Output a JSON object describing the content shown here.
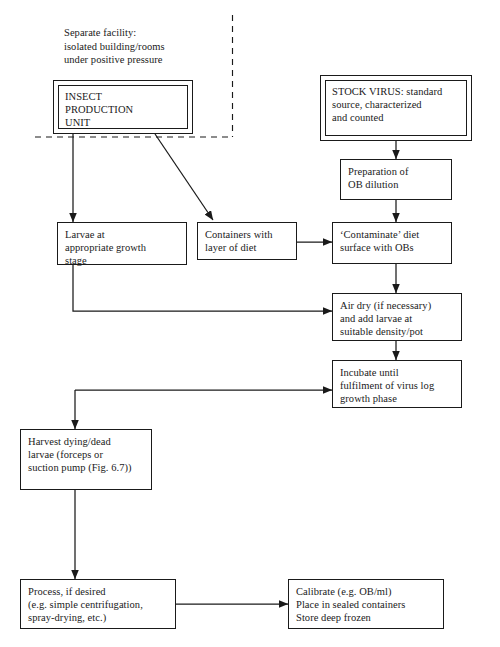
{
  "figure": {
    "kind": "process-flowchart",
    "title_text": "",
    "line_color": "#1a1a1a",
    "box_fill": "#ffffff",
    "page_background": "#ffffff"
  },
  "annotations": [
    {
      "name": "separate-facility-caption",
      "text": "Separate facility:\nisolated building/rooms\nunder positive pressure"
    }
  ],
  "nodes": [
    {
      "name": "insect-production-unit",
      "text": "INSECT\nPRODUCTION\nUNIT",
      "style": "double"
    },
    {
      "name": "stock-virus",
      "text": "STOCK VIRUS: standard\nsource, characterized\nand counted",
      "style": "double"
    },
    {
      "name": "preparation-of-ob-dilution",
      "text": "Preparation of\nOB dilution",
      "style": "single"
    },
    {
      "name": "larvae-at-growth-stage",
      "text": "Larvae at\nappropriate growth\nstage",
      "style": "single"
    },
    {
      "name": "containers-with-diet",
      "text": "Containers with\nlayer of diet",
      "style": "single"
    },
    {
      "name": "contaminate-diet-surface",
      "text": "‘Contaminate’ diet\nsurface with OBs",
      "style": "single"
    },
    {
      "name": "air-dry-add-larvae",
      "text": "Air dry (if necessary)\nand add larvae at\nsuitable density/pot",
      "style": "single"
    },
    {
      "name": "incubate-until-log-phase",
      "text": "Incubate until\nfulfilment of virus log\ngrowth phase",
      "style": "thick"
    },
    {
      "name": "harvest-dying-dead-larvae",
      "text": "Harvest dying/dead\nlarvae (forceps or\nsuction pump (Fig. 6.7))",
      "style": "thick"
    },
    {
      "name": "process-if-desired",
      "text": "Process, if desired\n(e.g. simple centrifugation,\nspray-drying, etc.)",
      "style": "thick"
    },
    {
      "name": "calibrate-store",
      "text": "Calibrate (e.g. OB/ml)\nPlace in sealed containers\nStore deep frozen",
      "style": "thick"
    }
  ],
  "containment_boundary": {
    "name": "containment-boundary",
    "kind": "dashed-line",
    "description": "dashed boundary delimiting the separate facility"
  },
  "connectors": [
    {
      "name": "connector-ipu-to-larvae",
      "from": "insect-production-unit",
      "to": "larvae-at-growth-stage"
    },
    {
      "name": "connector-ipu-to-containers",
      "from": "insect-production-unit",
      "to": "containers-with-diet"
    },
    {
      "name": "connector-stockvirus-to-preparation",
      "from": "stock-virus",
      "to": "preparation-of-ob-dilution"
    },
    {
      "name": "connector-preparation-to-contaminate",
      "from": "preparation-of-ob-dilution",
      "to": "contaminate-diet-surface"
    },
    {
      "name": "connector-containers-to-contaminate",
      "from": "containers-with-diet",
      "to": "contaminate-diet-surface"
    },
    {
      "name": "connector-contaminate-to-airdry",
      "from": "contaminate-diet-surface",
      "to": "air-dry-add-larvae"
    },
    {
      "name": "connector-larvae-to-airdry",
      "from": "larvae-at-growth-stage",
      "to": "air-dry-add-larvae"
    },
    {
      "name": "connector-airdry-to-incubate",
      "from": "air-dry-add-larvae",
      "to": "incubate-until-log-phase"
    },
    {
      "name": "connector-incubate-to-harvest",
      "from": "incubate-until-log-phase",
      "to": "harvest-dying-dead-larvae"
    },
    {
      "name": "connector-harvest-to-process",
      "from": "harvest-dying-dead-larvae",
      "to": "process-if-desired"
    },
    {
      "name": "connector-process-to-calibrate",
      "from": "process-if-desired",
      "to": "calibrate-store"
    }
  ]
}
